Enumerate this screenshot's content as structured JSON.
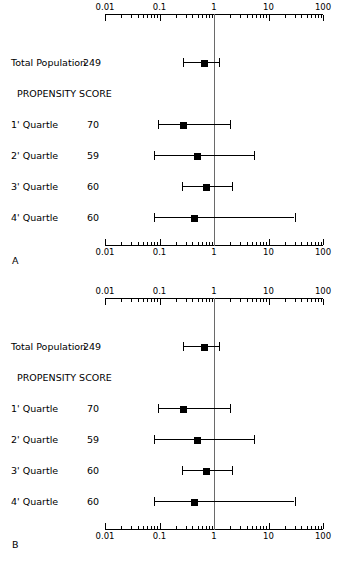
{
  "figure": {
    "type": "forest",
    "panels": [
      {
        "letter": "A",
        "axis": {
          "scale": "log10",
          "ticks": [
            "0.01",
            "0.1",
            "1",
            "10",
            "100"
          ],
          "tick_values": [
            0.01,
            0.1,
            1,
            10,
            100
          ],
          "reference_line": 1,
          "show_top_axis": true,
          "show_bottom_axis": true
        },
        "rows": [
          {
            "label": "Total Population",
            "n": "249",
            "estimate": 0.66,
            "low": 0.27,
            "high": 1.25,
            "type": "data"
          },
          {
            "label": "PROPENSITY SCORE",
            "n": "",
            "type": "header"
          },
          {
            "label": "1' Quartle",
            "n": "70",
            "estimate": 0.27,
            "low": 0.093,
            "high": 2.0,
            "type": "data"
          },
          {
            "label": "2' Quartle",
            "n": "59",
            "estimate": 0.5,
            "low": 0.08,
            "high": 5.5,
            "type": "data"
          },
          {
            "label": "3' Quartle",
            "n": "60",
            "estimate": 0.72,
            "low": 0.26,
            "high": 2.1,
            "type": "data"
          },
          {
            "label": "4' Quartle",
            "n": "60",
            "estimate": 0.44,
            "low": 0.08,
            "high": 30.0,
            "type": "data"
          }
        ]
      },
      {
        "letter": "B",
        "axis": {
          "scale": "log10",
          "ticks": [
            "0.01",
            "0.1",
            "1",
            "10",
            "100"
          ],
          "tick_values": [
            0.01,
            0.1,
            1,
            10,
            100
          ],
          "reference_line": 1,
          "show_top_axis": true,
          "show_bottom_axis": true
        },
        "rows": [
          {
            "label": "Total Population",
            "n": "249",
            "estimate": 0.66,
            "low": 0.27,
            "high": 1.25,
            "type": "data"
          },
          {
            "label": "PROPENSITY SCORE",
            "n": "",
            "type": "header"
          },
          {
            "label": "1' Quartle",
            "n": "70",
            "estimate": 0.27,
            "low": 0.093,
            "high": 2.0,
            "type": "data"
          },
          {
            "label": "2' Quartle",
            "n": "59",
            "estimate": 0.5,
            "low": 0.08,
            "high": 5.5,
            "type": "data"
          },
          {
            "label": "3' Quartle",
            "n": "60",
            "estimate": 0.72,
            "low": 0.26,
            "high": 2.1,
            "type": "data"
          },
          {
            "label": "4' Quartle",
            "n": "60",
            "estimate": 0.44,
            "low": 0.08,
            "high": 30.0,
            "type": "data"
          }
        ]
      }
    ]
  },
  "chart_data": {
    "type": "scatter",
    "title": "",
    "xlabel": "",
    "ylabel": "",
    "xscale": "log",
    "xlim": [
      0.01,
      100
    ],
    "grid": false,
    "legend": "none",
    "panels": [
      {
        "name": "A",
        "categories": [
          "Total Population 249",
          "1' Quartle 70",
          "2' Quartle 59",
          "3' Quartle 60",
          "4' Quartle 60"
        ],
        "values": [
          0.66,
          0.27,
          0.5,
          0.72,
          0.44
        ],
        "ci_low": [
          0.27,
          0.093,
          0.08,
          0.26,
          0.08
        ],
        "ci_high": [
          1.25,
          2.0,
          5.5,
          2.1,
          30.0
        ],
        "n": [
          249,
          70,
          59,
          60,
          60
        ],
        "reference_line": 1,
        "annotations": [
          "PROPENSITY SCORE"
        ]
      },
      {
        "name": "B",
        "categories": [
          "Total Population 249",
          "1' Quartle 70",
          "2' Quartle 59",
          "3' Quartle 60",
          "4' Quartle 60"
        ],
        "values": [
          0.66,
          0.27,
          0.5,
          0.72,
          0.44
        ],
        "ci_low": [
          0.27,
          0.093,
          0.08,
          0.26,
          0.08
        ],
        "ci_high": [
          1.25,
          2.0,
          5.5,
          2.1,
          30.0
        ],
        "n": [
          249,
          70,
          59,
          60,
          60
        ],
        "reference_line": 1,
        "annotations": [
          "PROPENSITY SCORE"
        ]
      }
    ]
  }
}
